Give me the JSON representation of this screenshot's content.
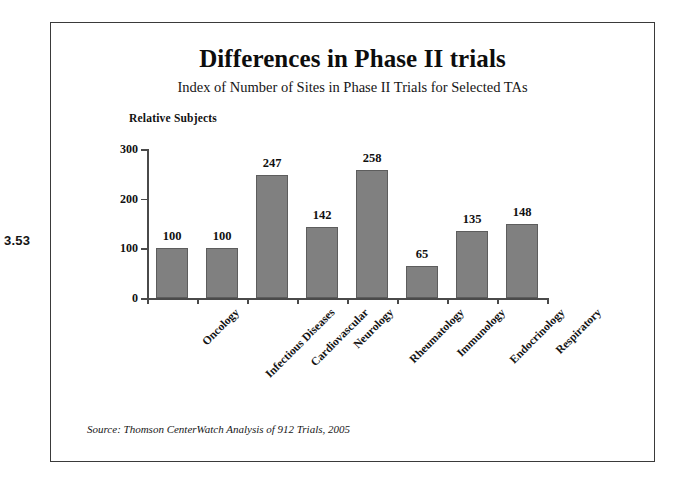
{
  "figure": {
    "number_label": "3.53"
  },
  "chart_data": {
    "type": "bar",
    "title": "Differences in Phase II trials",
    "subtitle": "Index of Number of Sites in Phase II Trials for Selected TAs",
    "xlabel": "",
    "ylabel": "Relative Subjects",
    "ylim": [
      0,
      300
    ],
    "yticks": [
      0,
      100,
      200,
      300
    ],
    "ytick_labels": [
      "0",
      "100",
      "200",
      "300"
    ],
    "grid": false,
    "legend": false,
    "bar_color": "#808080",
    "bar_edge_color": "#5d5d5d",
    "categories": [
      "Oncology",
      "Infectious Diseases",
      "Cardiovascular",
      "Neurology",
      "Rheumatology",
      "Immunology",
      "Endocrinology",
      "Respiratory"
    ],
    "values": [
      100,
      100,
      247,
      142,
      258,
      65,
      135,
      148
    ],
    "value_labels": [
      "100",
      "100",
      "247",
      "142",
      "258",
      "65",
      "135",
      "148"
    ],
    "source_note": "Source: Thomson CenterWatch Analysis of 912 Trials, 2005"
  }
}
